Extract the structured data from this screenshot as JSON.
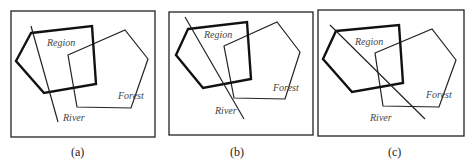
{
  "panels": [
    {
      "caption": "(a)",
      "labels": {
        "region": "Region",
        "forest": "Forest",
        "river": "River"
      },
      "description": "River crosses the Region polygon only"
    },
    {
      "caption": "(b)",
      "labels": {
        "region": "Region",
        "forest": "Forest",
        "river": "River"
      },
      "description": "River crosses Region and the overlap with Forest"
    },
    {
      "caption": "(c)",
      "labels": {
        "region": "Region",
        "forest": "Forest",
        "river": "River"
      },
      "description": "River crosses Region, overlap and Forest"
    }
  ]
}
